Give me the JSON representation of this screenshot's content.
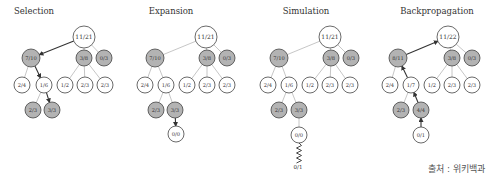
{
  "colors": {
    "node_fill_white": "#ffffff",
    "node_fill_gray": "#b3b3b3",
    "node_stroke": "#444444",
    "edge_light": "#b8b8b8",
    "edge_dark": "#333333",
    "text": "#333333"
  },
  "source_label": "출처 : 위키백과",
  "panels": [
    {
      "title": "Selection",
      "title_x": 34,
      "offset_x": 0,
      "nodes": [
        {
          "id": "root",
          "label": "11/21",
          "x": 84,
          "y": 37,
          "r": 11,
          "gray": false
        },
        {
          "id": "a",
          "label": "7/10",
          "x": 31,
          "y": 58,
          "r": 9,
          "gray": true
        },
        {
          "id": "b",
          "label": "3/8",
          "x": 84,
          "y": 58,
          "r": 8,
          "gray": true
        },
        {
          "id": "c",
          "label": "0/3",
          "x": 104,
          "y": 58,
          "r": 8,
          "gray": true
        },
        {
          "id": "a1",
          "label": "2/4",
          "x": 22,
          "y": 85,
          "r": 8,
          "gray": false
        },
        {
          "id": "a2",
          "label": "1/6",
          "x": 44,
          "y": 85,
          "r": 8,
          "gray": false
        },
        {
          "id": "b1",
          "label": "1/2",
          "x": 65,
          "y": 85,
          "r": 8,
          "gray": false
        },
        {
          "id": "b2",
          "label": "2/3",
          "x": 85,
          "y": 85,
          "r": 8,
          "gray": false
        },
        {
          "id": "b3",
          "label": "2/3",
          "x": 105,
          "y": 85,
          "r": 8,
          "gray": false
        },
        {
          "id": "a21",
          "label": "2/3",
          "x": 33,
          "y": 110,
          "r": 8,
          "gray": true
        },
        {
          "id": "a22",
          "label": "3/3",
          "x": 52,
          "y": 110,
          "r": 8,
          "gray": true
        }
      ],
      "edges": [
        {
          "from": "root",
          "to": "a",
          "style": "arrow-down"
        },
        {
          "from": "root",
          "to": "b",
          "style": "light"
        },
        {
          "from": "root",
          "to": "c",
          "style": "light"
        },
        {
          "from": "a",
          "to": "a1",
          "style": "light"
        },
        {
          "from": "a",
          "to": "a2",
          "style": "arrow-down"
        },
        {
          "from": "b",
          "to": "b1",
          "style": "light"
        },
        {
          "from": "b",
          "to": "b2",
          "style": "light"
        },
        {
          "from": "b",
          "to": "b3",
          "style": "light"
        },
        {
          "from": "a2",
          "to": "a21",
          "style": "light"
        },
        {
          "from": "a2",
          "to": "a22",
          "style": "arrow-down"
        }
      ]
    },
    {
      "title": "Expansion",
      "title_x": 171,
      "offset_x": 0,
      "nodes": [
        {
          "id": "root",
          "label": "11/21",
          "x": 206,
          "y": 37,
          "r": 11,
          "gray": false
        },
        {
          "id": "a",
          "label": "7/10",
          "x": 155,
          "y": 58,
          "r": 9,
          "gray": true
        },
        {
          "id": "b",
          "label": "3/8",
          "x": 207,
          "y": 58,
          "r": 8,
          "gray": true
        },
        {
          "id": "c",
          "label": "0/3",
          "x": 227,
          "y": 58,
          "r": 8,
          "gray": true
        },
        {
          "id": "a1",
          "label": "2/4",
          "x": 145,
          "y": 85,
          "r": 8,
          "gray": false
        },
        {
          "id": "a2",
          "label": "1/6",
          "x": 166,
          "y": 85,
          "r": 8,
          "gray": false
        },
        {
          "id": "b1",
          "label": "1/2",
          "x": 187,
          "y": 85,
          "r": 8,
          "gray": false
        },
        {
          "id": "b2",
          "label": "2/3",
          "x": 207,
          "y": 85,
          "r": 8,
          "gray": false
        },
        {
          "id": "b3",
          "label": "2/3",
          "x": 227,
          "y": 85,
          "r": 8,
          "gray": false
        },
        {
          "id": "a21",
          "label": "2/3",
          "x": 156,
          "y": 110,
          "r": 8,
          "gray": true
        },
        {
          "id": "a22",
          "label": "3/3",
          "x": 175,
          "y": 110,
          "r": 8,
          "gray": true
        },
        {
          "id": "new",
          "label": "0/0",
          "x": 176,
          "y": 134,
          "r": 8,
          "gray": false
        }
      ],
      "edges": [
        {
          "from": "root",
          "to": "a",
          "style": "light"
        },
        {
          "from": "root",
          "to": "b",
          "style": "light"
        },
        {
          "from": "root",
          "to": "c",
          "style": "light"
        },
        {
          "from": "a",
          "to": "a1",
          "style": "light"
        },
        {
          "from": "a",
          "to": "a2",
          "style": "light"
        },
        {
          "from": "b",
          "to": "b1",
          "style": "light"
        },
        {
          "from": "b",
          "to": "b2",
          "style": "light"
        },
        {
          "from": "b",
          "to": "b3",
          "style": "light"
        },
        {
          "from": "a2",
          "to": "a21",
          "style": "light"
        },
        {
          "from": "a2",
          "to": "a22",
          "style": "light"
        },
        {
          "from": "a22",
          "to": "new",
          "style": "arrow-down"
        }
      ]
    },
    {
      "title": "Simulation",
      "title_x": 306,
      "offset_x": 0,
      "nodes": [
        {
          "id": "root",
          "label": "11/21",
          "x": 330,
          "y": 37,
          "r": 11,
          "gray": false
        },
        {
          "id": "a",
          "label": "7/10",
          "x": 279,
          "y": 58,
          "r": 9,
          "gray": true
        },
        {
          "id": "b",
          "label": "3/8",
          "x": 331,
          "y": 58,
          "r": 8,
          "gray": true
        },
        {
          "id": "c",
          "label": "0/3",
          "x": 351,
          "y": 58,
          "r": 8,
          "gray": true
        },
        {
          "id": "a1",
          "label": "2/4",
          "x": 268,
          "y": 85,
          "r": 8,
          "gray": false
        },
        {
          "id": "a2",
          "label": "1/6",
          "x": 289,
          "y": 85,
          "r": 8,
          "gray": false
        },
        {
          "id": "b1",
          "label": "1/2",
          "x": 310,
          "y": 85,
          "r": 8,
          "gray": false
        },
        {
          "id": "b2",
          "label": "2/3",
          "x": 330,
          "y": 85,
          "r": 8,
          "gray": false
        },
        {
          "id": "b3",
          "label": "2/3",
          "x": 350,
          "y": 85,
          "r": 8,
          "gray": false
        },
        {
          "id": "a21",
          "label": "2/3",
          "x": 279,
          "y": 110,
          "r": 8,
          "gray": true
        },
        {
          "id": "a22",
          "label": "3/3",
          "x": 299,
          "y": 110,
          "r": 8,
          "gray": true
        },
        {
          "id": "new",
          "label": "0/0",
          "x": 299,
          "y": 135,
          "r": 8,
          "gray": false
        }
      ],
      "edges": [
        {
          "from": "root",
          "to": "a",
          "style": "light"
        },
        {
          "from": "root",
          "to": "b",
          "style": "light"
        },
        {
          "from": "root",
          "to": "c",
          "style": "light"
        },
        {
          "from": "a",
          "to": "a1",
          "style": "light"
        },
        {
          "from": "a",
          "to": "a2",
          "style": "light"
        },
        {
          "from": "b",
          "to": "b1",
          "style": "light"
        },
        {
          "from": "b",
          "to": "b2",
          "style": "light"
        },
        {
          "from": "b",
          "to": "b3",
          "style": "light"
        },
        {
          "from": "a2",
          "to": "a21",
          "style": "light"
        },
        {
          "from": "a2",
          "to": "a22",
          "style": "light"
        },
        {
          "from": "a22",
          "to": "new",
          "style": "light"
        }
      ],
      "rollout": {
        "from_x": 299,
        "from_y": 143,
        "to_y": 162,
        "label": "0/1",
        "label_x": 298,
        "label_y": 169
      }
    },
    {
      "title": "Backpropagation",
      "title_x": 437,
      "offset_x": 0,
      "nodes": [
        {
          "id": "root",
          "label": "11/22",
          "x": 448,
          "y": 37,
          "r": 11,
          "gray": false
        },
        {
          "id": "a",
          "label": "8/11",
          "x": 398,
          "y": 58,
          "r": 9,
          "gray": true
        },
        {
          "id": "b",
          "label": "3/8",
          "x": 452,
          "y": 58,
          "r": 8,
          "gray": true
        },
        {
          "id": "c",
          "label": "0/3",
          "x": 472,
          "y": 58,
          "r": 8,
          "gray": true
        },
        {
          "id": "a1",
          "label": "2/4",
          "x": 390,
          "y": 85,
          "r": 8,
          "gray": false
        },
        {
          "id": "a2",
          "label": "1/7",
          "x": 411,
          "y": 85,
          "r": 8,
          "gray": false
        },
        {
          "id": "b1",
          "label": "1/2",
          "x": 432,
          "y": 85,
          "r": 8,
          "gray": false
        },
        {
          "id": "b2",
          "label": "2/3",
          "x": 452,
          "y": 85,
          "r": 8,
          "gray": false
        },
        {
          "id": "b3",
          "label": "2/3",
          "x": 472,
          "y": 85,
          "r": 8,
          "gray": false
        },
        {
          "id": "a21",
          "label": "2/3",
          "x": 401,
          "y": 110,
          "r": 8,
          "gray": true
        },
        {
          "id": "a22",
          "label": "4/4",
          "x": 421,
          "y": 110,
          "r": 8,
          "gray": true
        },
        {
          "id": "new",
          "label": "0/1",
          "x": 421,
          "y": 135,
          "r": 8,
          "gray": false
        }
      ],
      "edges": [
        {
          "from": "a",
          "to": "root",
          "style": "arrow-up"
        },
        {
          "from": "root",
          "to": "b",
          "style": "light"
        },
        {
          "from": "root",
          "to": "c",
          "style": "light"
        },
        {
          "from": "a",
          "to": "a1",
          "style": "light"
        },
        {
          "from": "a2",
          "to": "a",
          "style": "arrow-up"
        },
        {
          "from": "b",
          "to": "b1",
          "style": "light"
        },
        {
          "from": "b",
          "to": "b2",
          "style": "light"
        },
        {
          "from": "b",
          "to": "b3",
          "style": "light"
        },
        {
          "from": "a2",
          "to": "a21",
          "style": "light"
        },
        {
          "from": "a22",
          "to": "a2",
          "style": "arrow-up"
        },
        {
          "from": "new",
          "to": "a22",
          "style": "arrow-up"
        }
      ]
    }
  ]
}
